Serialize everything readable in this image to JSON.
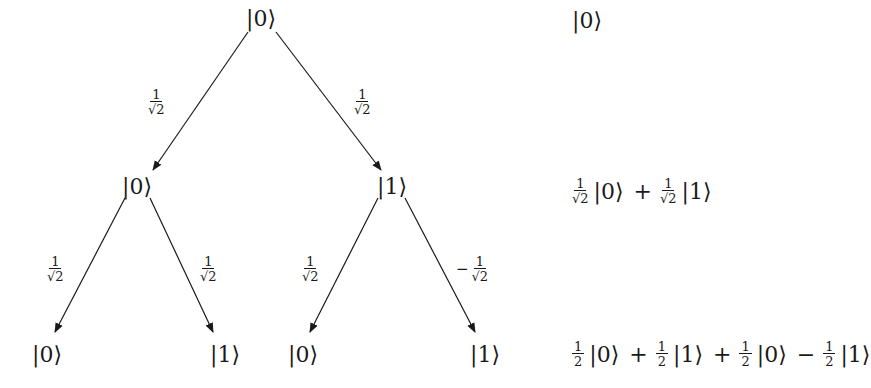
{
  "tree": {
    "root": {
      "label": "|0⟩"
    },
    "level1": [
      {
        "label": "|0⟩",
        "weight": {
          "sign": "",
          "num": "1",
          "den": "√2"
        }
      },
      {
        "label": "|1⟩",
        "weight": {
          "sign": "",
          "num": "1",
          "den": "√2"
        }
      }
    ],
    "level2": [
      {
        "label": "|0⟩",
        "weight": {
          "sign": "",
          "num": "1",
          "den": "√2"
        }
      },
      {
        "label": "|1⟩",
        "weight": {
          "sign": "",
          "num": "1",
          "den": "√2"
        }
      },
      {
        "label": "|0⟩",
        "weight": {
          "sign": "",
          "num": "1",
          "den": "√2"
        }
      },
      {
        "label": "|1⟩",
        "weight": {
          "sign": "−",
          "num": "1",
          "den": "√2"
        }
      }
    ]
  },
  "states": {
    "level0": {
      "ket": "|0⟩"
    },
    "level1": {
      "terms": [
        {
          "op": "",
          "num": "1",
          "den": "√2",
          "ket": "|0⟩"
        },
        {
          "op": "+",
          "num": "1",
          "den": "√2",
          "ket": "|1⟩"
        }
      ]
    },
    "level2": {
      "terms": [
        {
          "op": "",
          "num": "1",
          "den": "2",
          "ket": "|0⟩"
        },
        {
          "op": "+",
          "num": "1",
          "den": "2",
          "ket": "|1⟩"
        },
        {
          "op": "+",
          "num": "1",
          "den": "2",
          "ket": "|0⟩"
        },
        {
          "op": "−",
          "num": "1",
          "den": "2",
          "ket": "|1⟩"
        }
      ]
    }
  }
}
